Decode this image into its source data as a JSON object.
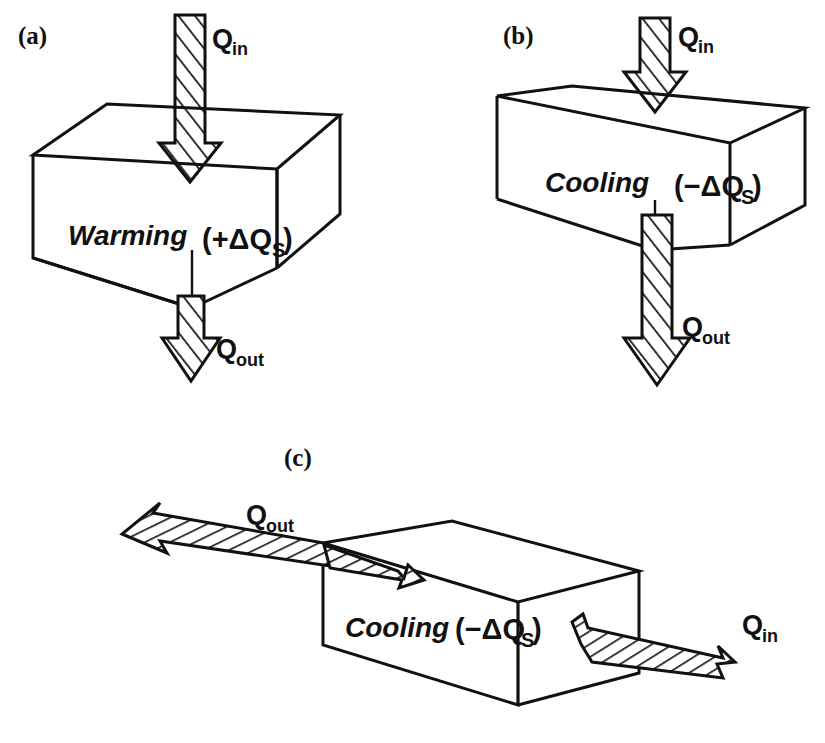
{
  "figure": {
    "background_color": "#ffffff",
    "ink_color": "#111111"
  },
  "panels": [
    {
      "id": "a",
      "label": "(a)",
      "state_word": "Warming",
      "storage_expr": "(+ΔQ",
      "storage_sub": "S",
      "storage_close": ")",
      "storage_sign": "+",
      "inflow": {
        "symbol": "Q",
        "subscript": "in",
        "direction": "down",
        "face": "top"
      },
      "outflow": {
        "symbol": "Q",
        "subscript": "out",
        "direction": "down",
        "face": "bottom"
      },
      "note": "Q_in arrow is thick, Q_out arrow is thin: inflow exceeds outflow so storage increases"
    },
    {
      "id": "b",
      "label": "(b)",
      "state_word": "Cooling",
      "storage_expr": "(−ΔQ",
      "storage_sub": "S",
      "storage_close": ")",
      "storage_sign": "−",
      "inflow": {
        "symbol": "Q",
        "subscript": "in",
        "direction": "down",
        "face": "top"
      },
      "outflow": {
        "symbol": "Q",
        "subscript": "out",
        "direction": "down",
        "face": "bottom"
      },
      "note": "Q_in arrow is short/thin, Q_out arrow is long/thick: outflow exceeds inflow so storage decreases"
    },
    {
      "id": "c",
      "label": "(c)",
      "state_word": "Cooling",
      "storage_expr": "(−ΔQ",
      "storage_sub": "S",
      "storage_close": ")",
      "storage_sign": "−",
      "inflow": {
        "symbol": "Q",
        "subscript": "in",
        "direction": "horizontal-left",
        "face": "right"
      },
      "outflow": {
        "symbol": "Q",
        "subscript": "out",
        "direction": "horizontal-left",
        "face": "left"
      },
      "note": "Horizontal advective flux: Q_in enters the right face, the larger Q_out leaves the left face"
    }
  ]
}
